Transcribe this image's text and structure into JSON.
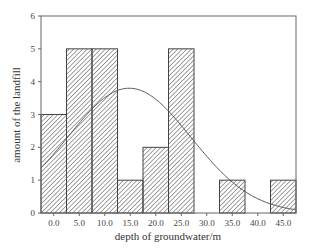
{
  "chart_data": {
    "type": "bar",
    "subtype": "histogram-with-normal-curve",
    "title": "",
    "xlabel": "depth of groundwater/m",
    "ylabel": "amount of the landfill",
    "categories": [
      "0.0",
      "5.0",
      "10.0",
      "15.0",
      "20.0",
      "25.0",
      "30.0",
      "35.0",
      "40.0",
      "45.0"
    ],
    "bin_centers": [
      0,
      5,
      10,
      15,
      20,
      25,
      30,
      35,
      40,
      45
    ],
    "bin_width": 5,
    "values": [
      3,
      5,
      5,
      1,
      2,
      5,
      0,
      1,
      0,
      1
    ],
    "xlim": [
      -2.5,
      47.5
    ],
    "ylim": [
      0,
      6
    ],
    "yticks": [
      0,
      1,
      2,
      3,
      4,
      5,
      6
    ],
    "xticks": [
      "0.0",
      "5.0",
      "10.0",
      "15.0",
      "20.0",
      "25.0",
      "30.0",
      "35.0",
      "40.0",
      "45.0"
    ],
    "normal_curve": {
      "mean": 14.8,
      "sd": 12.1,
      "peak": 3.8
    },
    "grid": false,
    "legend": "none",
    "bar_fill": "diagonal-hatch",
    "colors": {
      "axis": "#555555",
      "bar_edge": "#444444",
      "hatch": "#555555",
      "curve": "#555555"
    }
  }
}
